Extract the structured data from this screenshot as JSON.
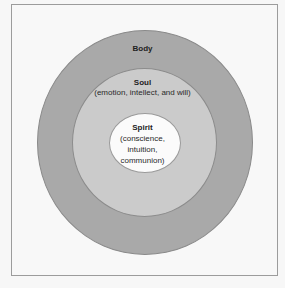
{
  "diagram": {
    "type": "concentric-circles",
    "layers": [
      {
        "name": "Body",
        "description": "",
        "fill": "#a9a9a9"
      },
      {
        "name": "Soul",
        "description": "(emotion, intellect, and will)",
        "fill": "#cbcbcb"
      },
      {
        "name": "Spirit",
        "description_lines": [
          "(conscience,",
          "intuition,",
          "communion)"
        ],
        "fill": "#fbfbfb"
      }
    ],
    "frame_border": "#9c9c9c",
    "background": "#f8f8f8"
  }
}
